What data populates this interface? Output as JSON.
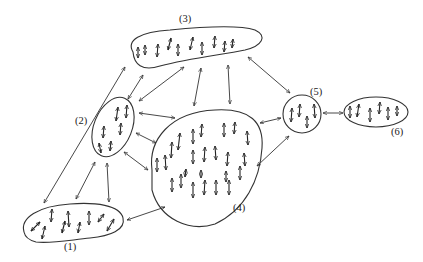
{
  "diagram": {
    "colors": {
      "ink": "#333333",
      "background": "#ffffff"
    },
    "clusters": [
      {
        "id": "1",
        "label": "(1)",
        "spin_count": 11
      },
      {
        "id": "2",
        "label": "(2)",
        "spin_count": 6
      },
      {
        "id": "3",
        "label": "(3)",
        "spin_count": 10
      },
      {
        "id": "4",
        "label": "(4)",
        "spin_count": 24
      },
      {
        "id": "5",
        "label": "(5)",
        "spin_count": 4
      },
      {
        "id": "6",
        "label": "(6)",
        "spin_count": 6
      }
    ],
    "connections": [
      {
        "from": "1",
        "to": "3",
        "type": "bidirectional"
      },
      {
        "from": "1",
        "to": "2",
        "type": "bidirectional"
      },
      {
        "from": "1",
        "to": "2",
        "type": "bidirectional"
      },
      {
        "from": "1",
        "to": "4",
        "type": "bidirectional"
      },
      {
        "from": "2",
        "to": "3",
        "type": "bidirectional"
      },
      {
        "from": "2",
        "to": "3",
        "type": "bidirectional"
      },
      {
        "from": "2",
        "to": "4",
        "type": "bidirectional"
      },
      {
        "from": "2",
        "to": "4",
        "type": "bidirectional"
      },
      {
        "from": "2",
        "to": "4",
        "type": "bidirectional"
      },
      {
        "from": "3",
        "to": "4",
        "type": "bidirectional"
      },
      {
        "from": "3",
        "to": "4",
        "type": "bidirectional"
      },
      {
        "from": "3",
        "to": "5",
        "type": "bidirectional"
      },
      {
        "from": "4",
        "to": "5",
        "type": "bidirectional"
      },
      {
        "from": "4",
        "to": "5",
        "type": "bidirectional"
      },
      {
        "from": "5",
        "to": "6",
        "type": "bidirectional"
      }
    ]
  }
}
